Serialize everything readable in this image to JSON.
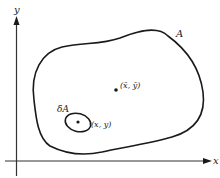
{
  "diagram": {
    "axes": {
      "x_label": "x",
      "y_label": "y"
    },
    "region": {
      "label": "A"
    },
    "centroid": {
      "label": "(x̄, ȳ)"
    },
    "element": {
      "label": "δA",
      "point_label": "(x, y)"
    },
    "colors": {
      "stroke": "#1a1a1a",
      "background": "#ffffff"
    }
  }
}
